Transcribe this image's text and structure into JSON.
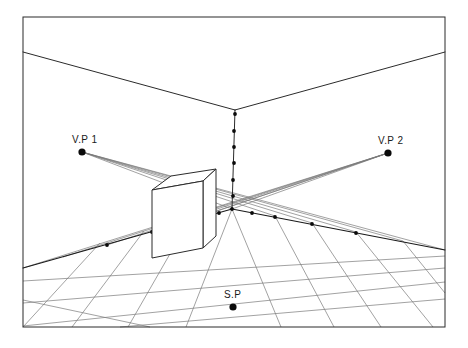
{
  "diagram": {
    "background_color": "#ffffff",
    "frame": {
      "x": 23,
      "y": 17,
      "width": 422,
      "height": 310,
      "stroke": "#2b2b2b"
    },
    "labels": {
      "vp1": "V.P 1",
      "vp2": "V.P 2",
      "sp": "S.P"
    },
    "points": {
      "vp1": {
        "x": 82,
        "y": 152,
        "r": 3.6
      },
      "vp2": {
        "x": 388,
        "y": 153,
        "r": 3.6
      },
      "sp": {
        "x": 233,
        "y": 307,
        "r": 3.6
      }
    },
    "label_positions": {
      "vp1": {
        "x": 72,
        "y": 143
      },
      "vp2": {
        "x": 378,
        "y": 144
      },
      "sp": {
        "x": 224,
        "y": 298
      }
    },
    "room": {
      "corner_top": {
        "x": 235,
        "y": 110
      },
      "corner_bottom": {
        "x": 232,
        "y": 209
      },
      "ceiling_left": {
        "x": 23,
        "y": 52
      },
      "ceiling_right": {
        "x": 445,
        "y": 52
      },
      "baseboard_left_end": {
        "x": 23,
        "y": 268
      },
      "baseboard_right_end": {
        "x": 445,
        "y": 250
      }
    },
    "box": {
      "front_top_left": {
        "x": 152,
        "y": 190
      },
      "front_top_right": {
        "x": 203,
        "y": 181
      },
      "front_bottom_right": {
        "x": 203,
        "y": 248
      },
      "front_bottom_left": {
        "x": 152,
        "y": 258
      },
      "back_top_left": {
        "x": 171,
        "y": 176
      },
      "back_top_right": {
        "x": 216,
        "y": 169
      },
      "back_bottom_right": {
        "x": 216,
        "y": 236
      }
    },
    "corner_dots_count": 7,
    "left_baseboard_dots_count": 4,
    "right_baseboard_dots_count": 6,
    "grid": {
      "description": "floor tiles converging to V.P 1 and V.P 2",
      "line_color": "#7a7a7a",
      "left_divisions": 5,
      "right_divisions": 6
    }
  }
}
